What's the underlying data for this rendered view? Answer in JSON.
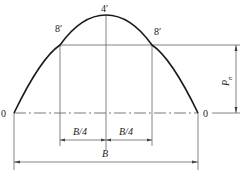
{
  "diagram": {
    "point_labels": {
      "left_base": "0",
      "right_base": "0",
      "apex": "4′",
      "left_quarter": "8′",
      "right_quarter": "8′"
    },
    "dimensions": {
      "quarter_left": "B/4",
      "quarter_right": "B/4",
      "total_width": "B",
      "height_symbol": "P",
      "height_subscript": "n"
    },
    "colors": {
      "curve": "#1a1a1a",
      "lines": "#666666",
      "background": "#ffffff"
    }
  }
}
